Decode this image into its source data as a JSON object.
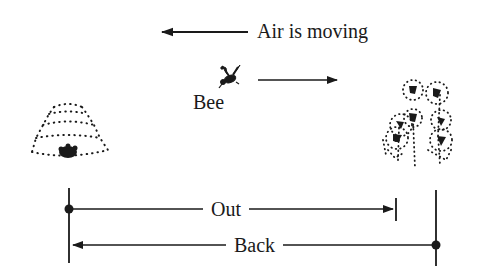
{
  "diagram": {
    "air_label": "Air is moving",
    "bee_label": "Bee",
    "out_label": "Out",
    "back_label": "Back",
    "icons": {
      "hive": "beehive-icon",
      "bee": "bee-icon",
      "flowers": "flowers-icon"
    },
    "colors": {
      "ink": "#1a1a1a",
      "background": "#ffffff"
    }
  }
}
